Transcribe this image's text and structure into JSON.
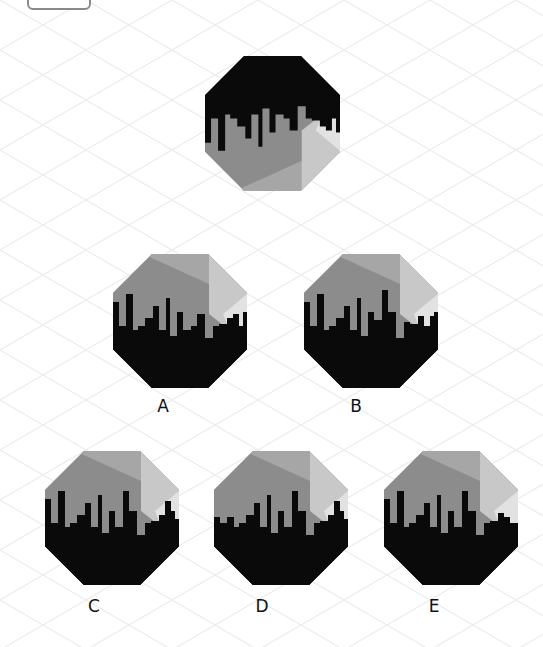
{
  "question": {
    "stem_figure": {
      "name": "stem",
      "flipped": true,
      "x": 205,
      "y": 56,
      "size": 135
    },
    "options": [
      {
        "label": "A",
        "x": 113,
        "y": 254,
        "size": 134,
        "label_x": 163,
        "label_y": 396
      },
      {
        "label": "B",
        "x": 304,
        "y": 254,
        "size": 134,
        "label_x": 356,
        "label_y": 396
      },
      {
        "label": "C",
        "x": 45,
        "y": 451,
        "size": 134,
        "label_x": 94,
        "label_y": 596
      },
      {
        "label": "D",
        "x": 214,
        "y": 451,
        "size": 134,
        "label_x": 262,
        "label_y": 596
      },
      {
        "label": "E",
        "x": 384,
        "y": 451,
        "size": 134,
        "label_x": 434,
        "label_y": 596
      }
    ]
  },
  "colors": {
    "black": "#0a0a0a",
    "gray_dark": "#8c8c8c",
    "gray_mid": "#a6a6a6",
    "gray_light": "#c8c8c8",
    "gray_lightest": "#e2e2e2",
    "grid": "#ececec"
  },
  "skylines": {
    "A": [
      [
        0,
        48,
        72
      ],
      [
        6,
        72,
        60
      ],
      [
        13,
        40,
        72
      ],
      [
        20,
        76,
        60
      ],
      [
        25,
        72,
        60
      ],
      [
        32,
        64,
        52
      ],
      [
        40,
        52,
        58
      ],
      [
        46,
        76,
        100
      ],
      [
        53,
        44,
        50
      ],
      [
        57,
        82,
        100
      ],
      [
        64,
        58,
        64
      ],
      [
        70,
        76,
        80
      ],
      [
        78,
        72,
        60
      ],
      [
        84,
        60,
        66
      ],
      [
        92,
        84,
        72
      ],
      [
        100,
        72,
        74
      ],
      [
        106,
        70,
        76
      ],
      [
        114,
        64,
        66
      ],
      [
        120,
        60,
        66
      ],
      [
        126,
        72,
        74
      ],
      [
        130,
        58,
        64
      ]
    ],
    "B": [
      [
        0,
        48,
        72
      ],
      [
        6,
        72,
        60
      ],
      [
        13,
        40,
        72
      ],
      [
        20,
        76,
        60
      ],
      [
        25,
        72,
        60
      ],
      [
        32,
        64,
        52
      ],
      [
        40,
        52,
        58
      ],
      [
        46,
        76,
        100
      ],
      [
        53,
        44,
        50
      ],
      [
        57,
        82,
        100
      ],
      [
        64,
        58,
        64
      ],
      [
        70,
        66,
        80
      ],
      [
        78,
        36,
        60
      ],
      [
        84,
        58,
        66
      ],
      [
        92,
        84,
        72
      ],
      [
        100,
        68,
        74
      ],
      [
        106,
        70,
        76
      ],
      [
        114,
        62,
        66
      ],
      [
        120,
        72,
        66
      ],
      [
        126,
        62,
        74
      ],
      [
        130,
        58,
        64
      ]
    ],
    "C": [
      [
        0,
        48,
        72
      ],
      [
        6,
        72,
        60
      ],
      [
        13,
        40,
        72
      ],
      [
        20,
        76,
        60
      ],
      [
        25,
        72,
        60
      ],
      [
        32,
        64,
        52
      ],
      [
        40,
        52,
        58
      ],
      [
        46,
        76,
        100
      ],
      [
        53,
        44,
        50
      ],
      [
        57,
        82,
        100
      ],
      [
        64,
        60,
        64
      ],
      [
        70,
        76,
        80
      ],
      [
        78,
        40,
        60
      ],
      [
        84,
        60,
        66
      ],
      [
        92,
        84,
        72
      ],
      [
        100,
        72,
        74
      ],
      [
        106,
        70,
        76
      ],
      [
        114,
        64,
        66
      ],
      [
        120,
        50,
        66
      ],
      [
        126,
        60,
        74
      ],
      [
        130,
        68,
        64
      ]
    ],
    "D": [
      [
        0,
        66,
        72
      ],
      [
        6,
        72,
        60
      ],
      [
        13,
        66,
        72
      ],
      [
        20,
        76,
        60
      ],
      [
        25,
        72,
        60
      ],
      [
        32,
        64,
        52
      ],
      [
        40,
        52,
        58
      ],
      [
        46,
        76,
        100
      ],
      [
        53,
        44,
        50
      ],
      [
        57,
        82,
        100
      ],
      [
        64,
        60,
        64
      ],
      [
        70,
        76,
        80
      ],
      [
        78,
        40,
        60
      ],
      [
        84,
        60,
        66
      ],
      [
        92,
        84,
        72
      ],
      [
        100,
        72,
        74
      ],
      [
        106,
        70,
        76
      ],
      [
        114,
        64,
        66
      ],
      [
        120,
        50,
        66
      ],
      [
        126,
        60,
        74
      ],
      [
        130,
        68,
        64
      ]
    ],
    "E": [
      [
        0,
        48,
        72
      ],
      [
        6,
        72,
        60
      ],
      [
        13,
        40,
        72
      ],
      [
        20,
        76,
        60
      ],
      [
        25,
        72,
        60
      ],
      [
        32,
        64,
        52
      ],
      [
        40,
        52,
        58
      ],
      [
        46,
        76,
        100
      ],
      [
        53,
        44,
        50
      ],
      [
        57,
        82,
        100
      ],
      [
        64,
        60,
        64
      ],
      [
        70,
        76,
        80
      ],
      [
        78,
        40,
        60
      ],
      [
        84,
        60,
        66
      ],
      [
        92,
        84,
        72
      ],
      [
        100,
        72,
        74
      ],
      [
        106,
        70,
        76
      ],
      [
        114,
        62,
        66
      ],
      [
        120,
        66,
        66
      ],
      [
        126,
        72,
        74
      ],
      [
        130,
        72,
        64
      ]
    ],
    "stem": [
      [
        0,
        48,
        72
      ],
      [
        6,
        72,
        60
      ],
      [
        13,
        40,
        72
      ],
      [
        20,
        76,
        60
      ],
      [
        25,
        72,
        60
      ],
      [
        32,
        64,
        52
      ],
      [
        40,
        52,
        58
      ],
      [
        46,
        76,
        100
      ],
      [
        53,
        44,
        50
      ],
      [
        57,
        82,
        100
      ],
      [
        64,
        58,
        64
      ],
      [
        70,
        76,
        80
      ],
      [
        78,
        72,
        60
      ],
      [
        84,
        60,
        66
      ],
      [
        92,
        84,
        72
      ],
      [
        100,
        72,
        74
      ],
      [
        106,
        70,
        76
      ],
      [
        114,
        64,
        66
      ],
      [
        120,
        60,
        66
      ],
      [
        126,
        72,
        74
      ],
      [
        130,
        58,
        64
      ]
    ]
  }
}
